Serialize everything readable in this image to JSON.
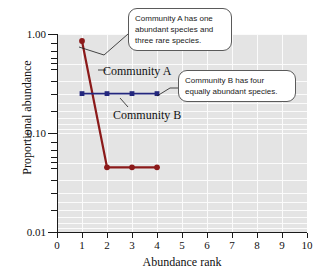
{
  "chart_data": {
    "type": "line",
    "title": "",
    "xlabel": "Abundance rank",
    "ylabel": "Proportional abundance",
    "xlim": [
      0,
      10
    ],
    "ylim": [
      0.01,
      1.0
    ],
    "yscale": "log",
    "grid": true,
    "legend_position": "inline-annotations",
    "x_ticks": [
      "0",
      "1",
      "2",
      "3",
      "4",
      "5",
      "6",
      "7",
      "8",
      "9",
      "10"
    ],
    "y_ticks": [
      "1.00",
      "0.10",
      "0.01"
    ],
    "series": [
      {
        "name": "Community A",
        "color": "#8B1A1A",
        "marker": "circle",
        "x": [
          1,
          2,
          3,
          4
        ],
        "values": [
          0.85,
          0.045,
          0.045,
          0.045
        ]
      },
      {
        "name": "Community B",
        "color": "#23277E",
        "marker": "square",
        "x": [
          1,
          2,
          3,
          4
        ],
        "values": [
          0.25,
          0.25,
          0.25,
          0.25
        ]
      }
    ],
    "annotations": [
      {
        "id": "callout-a",
        "text": "Community A has one abundant species and three rare species.",
        "points_to": "Community A first data point"
      },
      {
        "id": "callout-b",
        "text": "Community B has four equally abundant species.",
        "points_to": "Community B line"
      }
    ]
  },
  "series_labels": {
    "a": "Community A",
    "b": "Community B"
  }
}
